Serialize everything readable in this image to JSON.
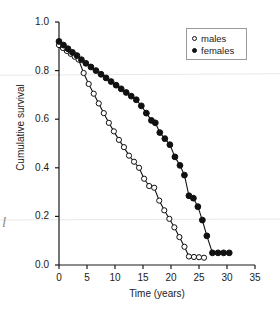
{
  "chart_data": {
    "type": "line",
    "title": "",
    "xlabel": "Time (years)",
    "ylabel": "Cumulative survival",
    "xlim": [
      0,
      35
    ],
    "ylim": [
      0.0,
      1.0
    ],
    "xticks": [
      0,
      5,
      10,
      15,
      20,
      25,
      30,
      35
    ],
    "yticks": [
      0.0,
      0.2,
      0.4,
      0.6,
      0.8,
      1.0
    ],
    "xtick_labels": [
      "0",
      "5",
      "10",
      "15",
      "20",
      "25",
      "30",
      "35"
    ],
    "ytick_labels": [
      "0.0",
      "0.2",
      "0.4",
      "0.6",
      "0.8",
      "1.0"
    ],
    "grid": false,
    "legend_position": "top-right",
    "series": [
      {
        "name": "males",
        "marker": "open-circle",
        "color": "#111111",
        "x": [
          0.0,
          0.7,
          1.4,
          2.1,
          2.8,
          3.5,
          4.4,
          5.3,
          6.2,
          7.1,
          8.0,
          8.9,
          9.8,
          10.7,
          11.6,
          12.5,
          13.4,
          14.3,
          15.2,
          16.1,
          17.0,
          17.9,
          18.8,
          19.7,
          20.6,
          21.5,
          22.4,
          23.2,
          24.1,
          25.0,
          25.9
        ],
        "y": [
          0.905,
          0.893,
          0.881,
          0.869,
          0.857,
          0.845,
          0.79,
          0.745,
          0.705,
          0.665,
          0.625,
          0.585,
          0.55,
          0.515,
          0.485,
          0.45,
          0.425,
          0.4,
          0.355,
          0.325,
          0.318,
          0.265,
          0.225,
          0.19,
          0.155,
          0.115,
          0.075,
          0.035,
          0.033,
          0.032,
          0.03
        ]
      },
      {
        "name": "females",
        "marker": "filled-circle",
        "color": "#111111",
        "x": [
          0.0,
          0.8,
          1.6,
          2.4,
          3.2,
          4.0,
          4.8,
          5.7,
          6.6,
          7.5,
          8.4,
          9.3,
          10.2,
          11.1,
          12.0,
          12.9,
          13.8,
          14.7,
          15.6,
          16.5,
          17.2,
          18.0,
          18.9,
          19.8,
          20.7,
          21.6,
          22.4,
          23.2,
          24.0,
          24.8,
          25.6,
          26.4,
          27.4,
          28.4,
          29.4,
          30.4
        ],
        "y": [
          0.92,
          0.905,
          0.89,
          0.875,
          0.862,
          0.845,
          0.83,
          0.815,
          0.8,
          0.785,
          0.77,
          0.755,
          0.74,
          0.725,
          0.71,
          0.695,
          0.68,
          0.655,
          0.625,
          0.595,
          0.585,
          0.545,
          0.52,
          0.495,
          0.445,
          0.41,
          0.37,
          0.285,
          0.275,
          0.24,
          0.185,
          0.12,
          0.05,
          0.05,
          0.05,
          0.05
        ]
      }
    ]
  },
  "legend": {
    "entries": [
      {
        "label": "males",
        "marker": "open-circle"
      },
      {
        "label": "females",
        "marker": "filled-circle"
      }
    ]
  },
  "artifacts": {
    "edge_glyph": "l"
  }
}
